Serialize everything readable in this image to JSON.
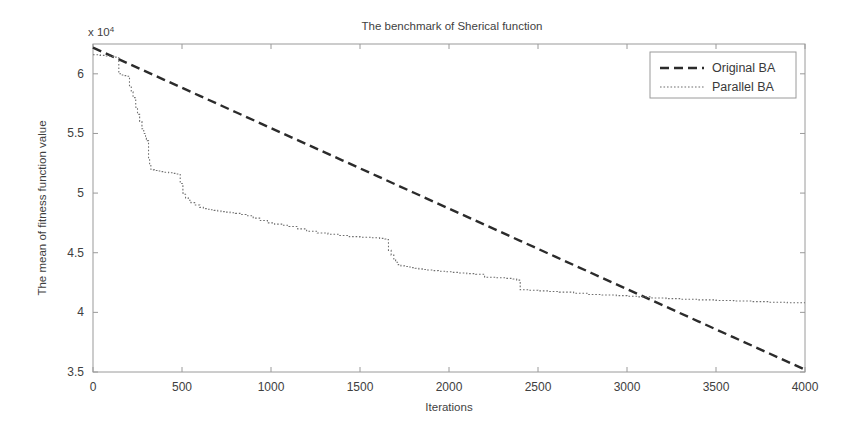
{
  "chart_data": {
    "type": "line",
    "title": "The benchmark of Sherical function",
    "xlabel": "Iterations",
    "ylabel": "The mean of fitness function value",
    "y_exponent_label": "x 10",
    "y_exponent_sup": "4",
    "y_scale_factor": 10000,
    "xlim": [
      0,
      4000
    ],
    "ylim": [
      3.5,
      6.25
    ],
    "xticks": [
      0,
      500,
      1000,
      1500,
      2000,
      2500,
      3000,
      3500,
      4000
    ],
    "xtick_labels": [
      "0",
      "500",
      "1000",
      "1500",
      "2000",
      "2500",
      "3000",
      "3500",
      "4000"
    ],
    "yticks": [
      3.5,
      4,
      4.5,
      5,
      5.5,
      6
    ],
    "ytick_labels": [
      "3.5",
      "4",
      "4.5",
      "5",
      "5.5",
      "6"
    ],
    "grid": false,
    "legend_position": "top-right",
    "series": [
      {
        "name": "Original BA",
        "color": "#2b2b2b",
        "style": "dashed",
        "dash_pattern": "9,5",
        "width": 2.4,
        "x": [
          0,
          200,
          400,
          600,
          800,
          1000,
          1200,
          1400,
          1600,
          1800,
          2000,
          2200,
          2400,
          2600,
          2800,
          3000,
          3200,
          3400,
          3600,
          3800,
          4000
        ],
        "y": [
          6.22,
          6.085,
          5.95,
          5.815,
          5.68,
          5.545,
          5.41,
          5.275,
          5.14,
          5.005,
          4.87,
          4.735,
          4.6,
          4.465,
          4.33,
          4.195,
          4.06,
          3.925,
          3.79,
          3.655,
          3.52
        ]
      },
      {
        "name": "Parallel BA",
        "color": "#6e6e6e",
        "style": "dotted",
        "dash_pattern": "1.6,1.9",
        "width": 1.1,
        "x": [
          0,
          40,
          70,
          95,
          115,
          130,
          145,
          160,
          175,
          190,
          205,
          215,
          225,
          240,
          250,
          262,
          275,
          285,
          295,
          300,
          305,
          312,
          318,
          325,
          335,
          345,
          360,
          380,
          400,
          425,
          450,
          470,
          490,
          505,
          510,
          520,
          535,
          550,
          575,
          600,
          620,
          640,
          660,
          680,
          700,
          720,
          745,
          770,
          800,
          830,
          860,
          900,
          940,
          980,
          1020,
          1060,
          1100,
          1150,
          1200,
          1260,
          1320,
          1380,
          1440,
          1500,
          1560,
          1610,
          1640,
          1650,
          1660,
          1675,
          1690,
          1700,
          1715,
          1730,
          1750,
          1770,
          1790,
          1810,
          1830,
          1850,
          1880,
          1910,
          1940,
          1980,
          2020,
          2060,
          2100,
          2150,
          2200,
          2260,
          2320,
          2360,
          2380,
          2400,
          2450,
          2500,
          2560,
          2620,
          2700,
          2780,
          2860,
          2940,
          3000,
          3060,
          3140,
          3220,
          3300,
          3400,
          3500,
          3600,
          3700,
          3800,
          3900,
          4000
        ],
        "y": [
          6.16,
          6.155,
          6.15,
          6.145,
          6.14,
          6.135,
          6.0,
          5.99,
          5.985,
          5.98,
          5.9,
          5.85,
          5.8,
          5.72,
          5.66,
          5.6,
          5.54,
          5.5,
          5.47,
          5.45,
          5.44,
          5.28,
          5.24,
          5.2,
          5.195,
          5.19,
          5.185,
          5.18,
          5.175,
          5.17,
          5.165,
          5.16,
          5.08,
          5.0,
          4.99,
          4.96,
          4.94,
          4.92,
          4.9,
          4.88,
          4.87,
          4.865,
          4.86,
          4.855,
          4.85,
          4.845,
          4.84,
          4.835,
          4.83,
          4.82,
          4.81,
          4.79,
          4.77,
          4.75,
          4.74,
          4.73,
          4.72,
          4.7,
          4.68,
          4.665,
          4.655,
          4.645,
          4.635,
          4.63,
          4.625,
          4.62,
          4.615,
          4.61,
          4.52,
          4.48,
          4.44,
          4.42,
          4.4,
          4.39,
          4.385,
          4.38,
          4.375,
          4.37,
          4.365,
          4.36,
          4.355,
          4.35,
          4.345,
          4.34,
          4.335,
          4.33,
          4.325,
          4.32,
          4.295,
          4.29,
          4.285,
          4.28,
          4.27,
          4.19,
          4.185,
          4.18,
          4.175,
          4.17,
          4.16,
          4.15,
          4.145,
          4.14,
          4.135,
          4.13,
          4.12,
          4.115,
          4.11,
          4.105,
          4.1,
          4.095,
          4.09,
          4.085,
          4.08,
          4.08
        ],
        "annotation": "staircase descent with plateaus; crosses Original BA near iteration 3000"
      }
    ]
  },
  "legend": {
    "entries": [
      {
        "label": "Original BA"
      },
      {
        "label": "Parallel BA"
      }
    ]
  }
}
